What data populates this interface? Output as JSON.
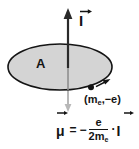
{
  "figure": {
    "background_color": "#ffffff",
    "stroke_color": "#141414",
    "loop_fill_color": "#d4d4d4",
    "axis_color": "#2a2a2a",
    "faint_axis_color": "#b3b3b3"
  },
  "labels": {
    "current_vector": "I",
    "area": "A",
    "electron": "(m",
    "electron_sub": "e",
    "electron_charge": ",−e)"
  },
  "formula": {
    "lhs": "μ",
    "equals": "=",
    "minus": "−",
    "numerator": "e",
    "denominator": "2m",
    "denominator_sub": "e",
    "dot": "·",
    "rhs_vector": "I"
  },
  "geometry": {
    "ellipse_center_x": 60,
    "ellipse_center_y": 67,
    "ellipse_radius_x": 52,
    "ellipse_radius_y": 23,
    "axis_x": 68,
    "axis_top_y": 10,
    "axis_bottom_y": 112,
    "electron_dot_x": 92,
    "electron_dot_y": 87
  }
}
